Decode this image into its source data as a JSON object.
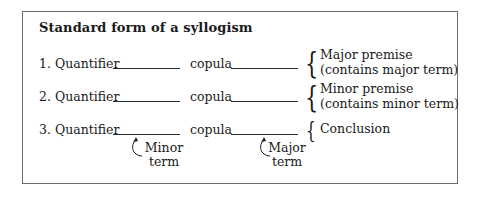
{
  "title": "Standard form of a syllogism",
  "rows": [
    {
      "number_label": "1. Quantifier",
      "copula_label": "copula",
      "role": [
        "Major premise",
        "(contains major term)"
      ]
    },
    {
      "number_label": "2. Quantifier",
      "copula_label": "copula",
      "role": [
        "Minor premise",
        "(contains minor term)"
      ]
    },
    {
      "number_label": "3. Quantifier",
      "copula_label": "copula",
      "role": [
        "Conclusion"
      ]
    }
  ],
  "annotations": {
    "subject_blank": [
      "Minor",
      "term"
    ],
    "predicate_blank": [
      "Major",
      "term"
    ]
  },
  "colors": {
    "text": "#1a1a1a",
    "frame": "#6e6e6e",
    "background": "#ffffff"
  }
}
